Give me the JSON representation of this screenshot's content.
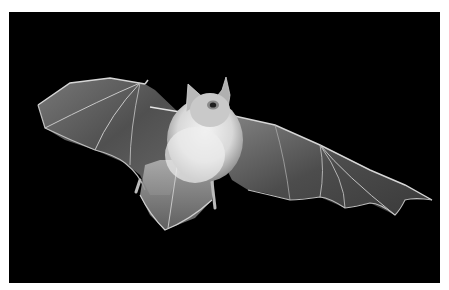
{
  "image": {
    "subject": "bat in flight",
    "background": "#000000",
    "border": "#ffffff",
    "colors": {
      "wing_membrane": "#6a6a6a",
      "wing_edge": "#cfcfcf",
      "fur": "#e6e6e6",
      "body_shadow": "#9a9a9a"
    }
  }
}
